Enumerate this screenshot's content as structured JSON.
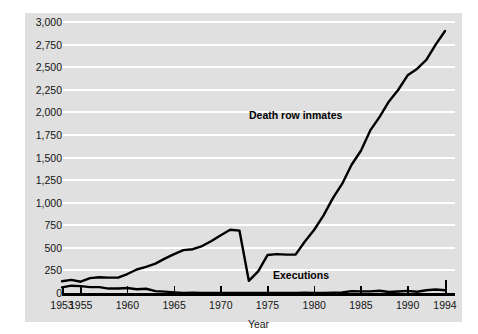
{
  "chart_data": {
    "type": "line",
    "title": "",
    "xlabel": "Year",
    "ylabel": "",
    "xlim": [
      1953,
      1994
    ],
    "ylim": [
      0,
      3000
    ],
    "grid": true,
    "legend_position": "inline-annotations",
    "yticks": [
      "0",
      "250",
      "500",
      "750",
      "1,000",
      "1,250",
      "1,500",
      "1,750",
      "2,000",
      "2,250",
      "2,500",
      "2,750",
      "3,000"
    ],
    "ytick_values": [
      0,
      250,
      500,
      750,
      1000,
      1250,
      1500,
      1750,
      2000,
      2250,
      2500,
      2750,
      3000
    ],
    "xticks": [
      "1953",
      "1955",
      "1960",
      "1965",
      "1970",
      "1975",
      "1980",
      "1985",
      "1990",
      "1994"
    ],
    "xtick_values": [
      1953,
      1955,
      1960,
      1965,
      1970,
      1975,
      1980,
      1985,
      1990,
      1994
    ],
    "x": [
      1953,
      1954,
      1955,
      1956,
      1957,
      1958,
      1959,
      1960,
      1961,
      1962,
      1963,
      1964,
      1965,
      1966,
      1967,
      1968,
      1969,
      1970,
      1971,
      1972,
      1973,
      1974,
      1975,
      1976,
      1977,
      1978,
      1979,
      1980,
      1981,
      1982,
      1983,
      1984,
      1985,
      1986,
      1987,
      1988,
      1989,
      1990,
      1991,
      1992,
      1993,
      1994
    ],
    "series": [
      {
        "name": "Death row inmates",
        "color": "#000000",
        "values": [
          130,
          145,
          125,
          165,
          175,
          170,
          170,
          210,
          260,
          290,
          325,
          380,
          430,
          475,
          485,
          520,
          575,
          640,
          700,
          690,
          135,
          240,
          420,
          430,
          425,
          425,
          570,
          700,
          860,
          1050,
          1210,
          1420,
          1575,
          1800,
          1950,
          2120,
          2250,
          2410,
          2480,
          2580,
          2750,
          2900
        ]
      },
      {
        "name": "Executions",
        "color": "#000000",
        "values": [
          62,
          81,
          76,
          65,
          65,
          49,
          49,
          56,
          42,
          47,
          21,
          15,
          7,
          1,
          2,
          0,
          0,
          0,
          0,
          0,
          0,
          0,
          0,
          0,
          1,
          0,
          2,
          0,
          1,
          2,
          5,
          21,
          18,
          18,
          25,
          11,
          16,
          23,
          14,
          31,
          38,
          31
        ]
      }
    ],
    "annotations": [
      {
        "text": "Death row inmates",
        "x": 1973,
        "y": 2000
      },
      {
        "text": "Executions",
        "x": 1980,
        "y": 180
      }
    ]
  },
  "colors": {
    "panel_background": "#e0e0e0",
    "gridline": "#ffffff",
    "axis": "#000000",
    "text": "#141414",
    "page_background": "#ffffff"
  }
}
